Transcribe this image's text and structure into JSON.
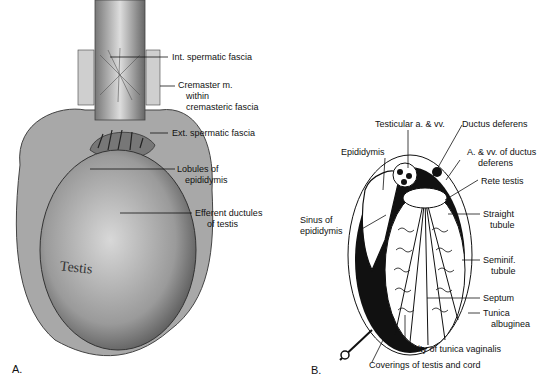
{
  "figure_a": {
    "panel_label": "A.",
    "organ_text": "Testis",
    "labels": {
      "int_spermatic_fascia": "Int. spermatic fascia",
      "cremaster_1": "Cremaster m.",
      "cremaster_2": "within",
      "cremaster_3": "cremasteric fascia",
      "ext_spermatic_fascia": "Ext. spermatic fascia",
      "lobules_1": "Lobules of",
      "lobules_2": "epididymis",
      "efferent_1": "Efferent ductules",
      "efferent_2": "of testis"
    }
  },
  "figure_b": {
    "panel_label": "B.",
    "labels": {
      "testicular_vessels": "Testicular a. & vv.",
      "ductus_deferens": "Ductus deferens",
      "epididymis": "Epididymis",
      "a_vv_ductus_1": "A. & vv. of ductus",
      "a_vv_ductus_2": "deferens",
      "rete_testis": "Rete testis",
      "sinus_1": "Sinus of",
      "sinus_2": "epididymis",
      "straight_1": "Straight",
      "straight_2": "tubule",
      "seminif_1": "Seminif.",
      "seminif_2": "tubule",
      "septum": "Septum",
      "tunica_alb_1": "Tunica",
      "tunica_alb_2": "albuginea",
      "cavity_tunica_vaginalis": "Cavity of tunica vaginalis",
      "coverings": "Coverings of testis and cord"
    }
  }
}
